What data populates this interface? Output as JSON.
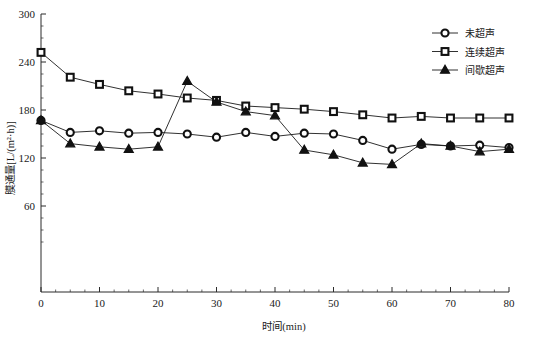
{
  "chart_data": {
    "type": "line",
    "title": "",
    "xlabel": "时间(min)",
    "ylabel": "膜通量[L/(m²·h)]",
    "xlim": [
      0,
      80
    ],
    "ylim": [
      0,
      300
    ],
    "xticks": [
      0,
      10,
      20,
      30,
      40,
      50,
      60,
      70,
      80
    ],
    "xtick_labels": [
      "0",
      "10",
      "20",
      "30",
      "40",
      "50",
      "60",
      "70",
      "80"
    ],
    "yticks": [
      60,
      120,
      180,
      240,
      300
    ],
    "ytick_labels": [
      "60",
      "120",
      "180",
      "240",
      "300"
    ],
    "x_minor_step": 2.5,
    "y_minor_step": 15,
    "grid": false,
    "legend_position": "top-right",
    "x": [
      0,
      5,
      10,
      15,
      20,
      25,
      30,
      35,
      40,
      45,
      50,
      55,
      60,
      65,
      70,
      75,
      80
    ],
    "series": [
      {
        "name": "未超声",
        "marker": "circle",
        "values": [
          167,
          152,
          154,
          151,
          152,
          150,
          146,
          152,
          147,
          151,
          150,
          142,
          131,
          137,
          135,
          136,
          133
        ]
      },
      {
        "name": "连续超声",
        "marker": "square",
        "values": [
          252,
          221,
          212,
          204,
          200,
          195,
          192,
          185,
          183,
          181,
          178,
          174,
          170,
          172,
          170,
          170,
          170
        ]
      },
      {
        "name": "间歇超声",
        "marker": "triangle",
        "values": [
          167,
          138,
          134,
          131,
          134,
          216,
          190,
          178,
          173,
          130,
          124,
          114,
          112,
          138,
          135,
          128,
          131
        ]
      }
    ]
  },
  "legend": {
    "items": [
      {
        "label": "未超声",
        "marker": "circle-marker"
      },
      {
        "label": "连续超声",
        "marker": "square-marker"
      },
      {
        "label": "间歇超声",
        "marker": "triangle-marker"
      }
    ]
  },
  "axes": {
    "x_axis_title": "时间(min)",
    "y_axis_title": "膜通量[L/(m²·h)]"
  },
  "colors": {
    "line": "#1a1a1a",
    "marker_fill": "#ffffff",
    "marker_stroke": "#111111",
    "triangle_fill": "#111111",
    "axis": "#2b2b2b",
    "background": "#ffffff"
  }
}
